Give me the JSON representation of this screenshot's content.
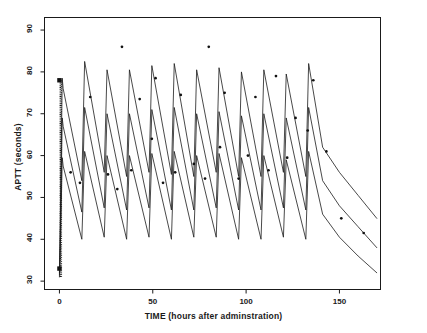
{
  "chart_data": {
    "type": "line",
    "title": "",
    "xlabel": "TIME (hours after adminstration)",
    "ylabel": "APTT (seconds)",
    "xlim": [
      -8,
      172
    ],
    "ylim": [
      28,
      93
    ],
    "grid": false,
    "legend": "none",
    "xticks": [
      0,
      50,
      100,
      150
    ],
    "xtick_labels": [
      "0",
      "50",
      "100",
      "150"
    ],
    "yticks": [
      30,
      40,
      50,
      60,
      70,
      80,
      90
    ],
    "ytick_labels": [
      "30",
      "40",
      "50",
      "60",
      "70",
      "80",
      "90"
    ],
    "series": [
      {
        "name": "upper-percentile-simulation",
        "style": "line",
        "x": [
          0,
          0.5,
          1.5,
          2.0,
          12.0,
          13.5,
          24.0,
          25.5,
          36.0,
          37.5,
          48.0,
          49.5,
          60.0,
          61.5,
          72.0,
          73.5,
          84.0,
          85.5,
          96.0,
          97.5,
          108.0,
          109.5,
          120.0,
          121.5,
          132.0,
          133.5,
          141.0,
          150.0,
          160.0,
          170.0
        ],
        "y": [
          32.0,
          46.0,
          78.5,
          76.0,
          54.0,
          82.5,
          56.0,
          80.5,
          55.0,
          80.5,
          56.0,
          81.5,
          55.5,
          82.0,
          55.0,
          80.5,
          56.0,
          81.0,
          55.0,
          80.0,
          55.0,
          80.5,
          56.0,
          79.5,
          55.0,
          82.0,
          62.0,
          56.0,
          50.5,
          45.0
        ]
      },
      {
        "name": "median-simulation",
        "style": "line",
        "x": [
          0,
          0.5,
          1.5,
          2.0,
          12.0,
          13.5,
          24.0,
          25.5,
          36.0,
          37.5,
          48.0,
          49.5,
          60.0,
          61.5,
          72.0,
          73.5,
          84.0,
          85.5,
          96.0,
          97.5,
          108.0,
          109.5,
          120.0,
          121.5,
          132.0,
          133.5,
          141.0,
          150.0,
          160.0,
          170.0
        ],
        "y": [
          31.5,
          42.0,
          69.0,
          67.0,
          46.5,
          71.5,
          47.5,
          70.0,
          47.0,
          70.0,
          47.5,
          71.0,
          47.0,
          71.5,
          47.0,
          70.0,
          47.5,
          70.5,
          47.0,
          69.5,
          47.0,
          70.0,
          47.5,
          69.0,
          47.0,
          71.5,
          54.0,
          48.0,
          43.0,
          38.0
        ]
      },
      {
        "name": "lower-percentile-simulation",
        "style": "line",
        "x": [
          0,
          0.5,
          1.5,
          2.0,
          12.0,
          13.5,
          24.0,
          25.5,
          36.0,
          37.5,
          48.0,
          49.5,
          60.0,
          61.5,
          72.0,
          73.5,
          84.0,
          85.5,
          96.0,
          97.5,
          108.0,
          109.5,
          120.0,
          121.5,
          132.0,
          133.5,
          141.0,
          150.0,
          160.0,
          170.0
        ],
        "y": [
          31.0,
          38.0,
          59.5,
          57.5,
          40.0,
          61.0,
          40.5,
          60.0,
          40.0,
          60.0,
          40.5,
          60.5,
          40.0,
          61.0,
          40.5,
          60.0,
          40.5,
          60.5,
          40.0,
          59.5,
          40.0,
          60.0,
          40.5,
          59.0,
          40.0,
          61.0,
          46.0,
          40.5,
          36.0,
          32.0
        ]
      }
    ],
    "scatter": {
      "name": "observed-apt-values",
      "marker": "dot",
      "points": [
        [
          0,
          78.0
        ],
        [
          0,
          33.0
        ],
        [
          6.0,
          56.0
        ],
        [
          11.0,
          53.5
        ],
        [
          16.5,
          74.0
        ],
        [
          26.0,
          55.5
        ],
        [
          31.0,
          52.0
        ],
        [
          33.5,
          86.0
        ],
        [
          38.5,
          56.5
        ],
        [
          43.0,
          73.5
        ],
        [
          49.5,
          64.0
        ],
        [
          51.5,
          78.5
        ],
        [
          55.5,
          53.5
        ],
        [
          62.0,
          56.0
        ],
        [
          65.0,
          74.5
        ],
        [
          72.0,
          58.0
        ],
        [
          78.0,
          54.5
        ],
        [
          80.0,
          86.0
        ],
        [
          86.0,
          62.0
        ],
        [
          88.5,
          75.0
        ],
        [
          96.0,
          54.5
        ],
        [
          101.0,
          60.0
        ],
        [
          105.0,
          74.0
        ],
        [
          112.0,
          56.5
        ],
        [
          116.0,
          79.0
        ],
        [
          122.0,
          59.5
        ],
        [
          126.5,
          69.0
        ],
        [
          133.0,
          66.0
        ],
        [
          136.0,
          78.0
        ],
        [
          143.0,
          61.0
        ],
        [
          151.0,
          45.0
        ],
        [
          163.0,
          41.5
        ]
      ],
      "square_markers": [
        [
          0,
          78.0
        ],
        [
          0,
          33.0
        ]
      ]
    },
    "dense_band": {
      "name": "initial-rise-dotted-band",
      "x": 0.5,
      "y_from": 31.0,
      "y_to": 78.0
    },
    "colors": {
      "line": "#1a1a1a",
      "marker": "#111111",
      "axis": "#1a1a1a",
      "background": "#ffffff"
    }
  },
  "axes": {
    "x_title": "TIME (hours after adminstration)",
    "y_title": "APTT (seconds)",
    "x_tick_labels": [
      "0",
      "50",
      "100",
      "150"
    ],
    "y_tick_labels": [
      "30",
      "40",
      "50",
      "60",
      "70",
      "80",
      "90"
    ]
  }
}
